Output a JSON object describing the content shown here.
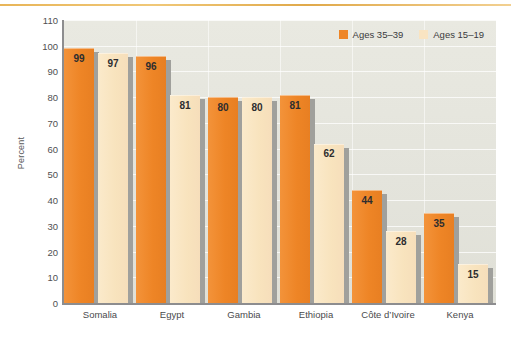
{
  "chart_data": {
    "type": "bar",
    "title": "",
    "subtitle": "",
    "xlabel": "",
    "ylabel": "Percent",
    "ylim": [
      0,
      110
    ],
    "ytick_step": 10,
    "yticks": [
      0,
      10,
      20,
      30,
      40,
      50,
      60,
      70,
      80,
      90,
      100,
      110
    ],
    "grid": true,
    "legend_position": "top-right",
    "categories": [
      "Somalia",
      "Egypt",
      "Gambia",
      "Ethiopia",
      "Côte d’Ivoire",
      "Kenya"
    ],
    "series": [
      {
        "name": "Ages 35–39",
        "color": "#ee8526",
        "values": [
          99,
          96,
          80,
          81,
          44,
          35
        ]
      },
      {
        "name": "Ages 15–19",
        "color": "#f9e4c2",
        "values": [
          97,
          81,
          80,
          62,
          28,
          15
        ]
      }
    ]
  },
  "colors": {
    "series_1": "#ee8526",
    "series_2": "#f9e4c2",
    "plot_background": "#e6e6de",
    "axis_line": "#8d8d8f",
    "gridline": "#ffffff",
    "bar_shadow": "#a0a09c",
    "top_rule": "#e8b558",
    "page_background": "#ffffff",
    "tick_text": "#4f4f51"
  }
}
